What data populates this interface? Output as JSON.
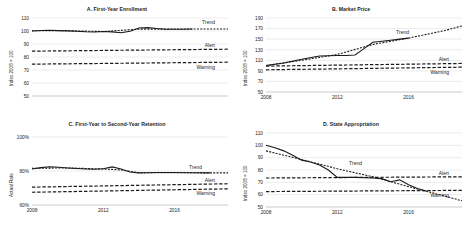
{
  "figure": {
    "panel_count": 4,
    "annotation_labels": {
      "trend": "Trend",
      "alert": "Alert",
      "warning": "Warning"
    }
  },
  "chart_data": [
    {
      "type": "line",
      "panel": "A",
      "title": "A. First-Year Enrollment",
      "xlabel": "",
      "ylabel": "Index 2008 = 100",
      "ylim": [
        50,
        110
      ],
      "yticks": [
        50,
        60,
        70,
        80,
        90,
        100,
        110
      ],
      "ytick_labels": [
        "50",
        "60",
        "70",
        "80",
        "90",
        "100",
        "110"
      ],
      "xlim": [
        2008,
        2019
      ],
      "xticks": [],
      "xtick_labels": [],
      "grid": true,
      "legend": "inline-annotations",
      "series": [
        {
          "name": "Actual",
          "style": "solid",
          "x": [
            2008,
            2008.5,
            2009,
            2009.5,
            2010,
            2010.5,
            2011,
            2011.5,
            2012,
            2012.5,
            2013,
            2013.5,
            2014,
            2014.5,
            2015,
            2015.5,
            2016,
            2016.5,
            2017
          ],
          "values": [
            100,
            100.4,
            100.6,
            100.3,
            100.1,
            99.8,
            99.4,
            99.2,
            99.6,
            99.3,
            98.6,
            99.8,
            102.3,
            102.6,
            101.9,
            101.4,
            101.3,
            101.4,
            101.5
          ]
        },
        {
          "name": "Trend",
          "style": "dashed",
          "x": [
            2008,
            2010,
            2012,
            2014,
            2016,
            2018,
            2019
          ],
          "values": [
            100.2,
            100.2,
            99.6,
            101.4,
            101.5,
            101.5,
            101.5
          ]
        },
        {
          "name": "Alert",
          "style": "long-dash",
          "x": [
            2008,
            2019
          ],
          "values": [
            84.5,
            86
          ]
        },
        {
          "name": "Warning",
          "style": "long-dash",
          "x": [
            2008,
            2019
          ],
          "values": [
            74.5,
            76
          ]
        }
      ]
    },
    {
      "type": "line",
      "panel": "B",
      "title": "B. Market Price",
      "xlabel": "",
      "ylabel": "Index 2008 = 100",
      "ylim": [
        50,
        190
      ],
      "yticks": [
        50,
        70,
        90,
        110,
        130,
        150,
        170,
        190
      ],
      "ytick_labels": [
        "50",
        "70",
        "90",
        "110",
        "130",
        "150",
        "170",
        "190"
      ],
      "xlim": [
        2008,
        2019
      ],
      "xticks": [
        2008,
        2012,
        2016
      ],
      "xtick_labels": [
        "2008",
        "2012",
        "2016"
      ],
      "grid": true,
      "legend": "inline-annotations",
      "series": [
        {
          "name": "Actual",
          "style": "solid",
          "x": [
            2008,
            2009,
            2010,
            2011,
            2012,
            2012.5,
            2013,
            2013.5,
            2014,
            2014.5,
            2015,
            2015.5,
            2016
          ],
          "values": [
            100,
            105,
            112,
            118,
            119,
            119,
            120,
            132,
            144,
            146,
            148,
            150,
            152
          ]
        },
        {
          "name": "Trend",
          "style": "dashed",
          "x": [
            2008,
            2010,
            2012,
            2014,
            2016,
            2018,
            2019
          ],
          "values": [
            100,
            110,
            121,
            140,
            152,
            166,
            175
          ]
        },
        {
          "name": "Alert",
          "style": "long-dash",
          "x": [
            2008,
            2019
          ],
          "values": [
            99,
            104
          ]
        },
        {
          "name": "Warning",
          "style": "long-dash",
          "x": [
            2008,
            2019
          ],
          "values": [
            92,
            97
          ]
        }
      ]
    },
    {
      "type": "line",
      "panel": "C",
      "title": "C. First-Year to Second-Year Retention",
      "xlabel": "",
      "ylabel": "Actual Rate",
      "ylim": [
        60,
        100
      ],
      "yticks": [
        60,
        80,
        100
      ],
      "ytick_labels": [
        "60%",
        "80%",
        "100%"
      ],
      "xlim": [
        2008,
        2019
      ],
      "xticks": [
        2008,
        2012,
        2016
      ],
      "xtick_labels": [
        "2008",
        "2012",
        "2016"
      ],
      "grid": true,
      "legend": "inline-annotations",
      "series": [
        {
          "name": "Actual",
          "style": "solid",
          "x": [
            2008,
            2008.5,
            2009,
            2009.5,
            2010,
            2010.5,
            2011,
            2011.5,
            2012,
            2012.5,
            2013,
            2013.5,
            2014,
            2014.5,
            2015,
            2016,
            2017,
            2018
          ],
          "values": [
            81.2,
            82.0,
            82.5,
            82.2,
            81.8,
            81.5,
            81.2,
            81.0,
            81.3,
            82.4,
            81.2,
            79.4,
            78.9,
            79.0,
            79.1,
            79.1,
            79.0,
            78.9
          ]
        },
        {
          "name": "Trend",
          "style": "dashed",
          "x": [
            2008,
            2010,
            2012,
            2013,
            2014,
            2016,
            2018,
            2019
          ],
          "values": [
            81.6,
            81.8,
            81.2,
            80.6,
            79.0,
            79.0,
            78.9,
            78.9
          ]
        },
        {
          "name": "Alert",
          "style": "long-dash",
          "x": [
            2008,
            2019
          ],
          "values": [
            70.5,
            72.5
          ]
        },
        {
          "name": "Warning",
          "style": "long-dash",
          "x": [
            2008,
            2019
          ],
          "values": [
            67.5,
            69.5
          ]
        }
      ]
    },
    {
      "type": "line",
      "panel": "D",
      "title": "D. State Appropriation",
      "xlabel": "",
      "ylabel": "Index 2008 = 100",
      "ylim": [
        50,
        110
      ],
      "yticks": [
        50,
        60,
        70,
        80,
        90,
        100,
        110
      ],
      "ytick_labels": [
        "50",
        "60",
        "70",
        "80",
        "90",
        "100",
        "110"
      ],
      "xlim": [
        2008,
        2019
      ],
      "xticks": [
        2008,
        2012,
        2016
      ],
      "xtick_labels": [
        "2008",
        "2012",
        "2016"
      ],
      "grid": true,
      "legend": "inline-annotations",
      "series": [
        {
          "name": "Actual",
          "style": "solid",
          "x": [
            2008,
            2008.5,
            2009,
            2009.5,
            2010,
            2010.5,
            2011,
            2011.5,
            2012,
            2013,
            2014,
            2014.5,
            2015,
            2015.5,
            2016,
            2016.5,
            2017
          ],
          "values": [
            100,
            98,
            95.5,
            92,
            88,
            86.5,
            84,
            80,
            74,
            74,
            73.5,
            73,
            70.5,
            72,
            68,
            65,
            63
          ]
        },
        {
          "name": "Trend",
          "style": "dashed",
          "x": [
            2008,
            2010,
            2012,
            2014,
            2016,
            2018,
            2019
          ],
          "values": [
            95.5,
            88.5,
            81,
            74.5,
            66.5,
            59,
            55
          ]
        },
        {
          "name": "Alert",
          "style": "long-dash",
          "x": [
            2008,
            2019
          ],
          "values": [
            73.5,
            74.5
          ]
        },
        {
          "name": "Warning",
          "style": "long-dash",
          "x": [
            2008,
            2019
          ],
          "values": [
            62.5,
            63.5
          ]
        }
      ]
    }
  ]
}
